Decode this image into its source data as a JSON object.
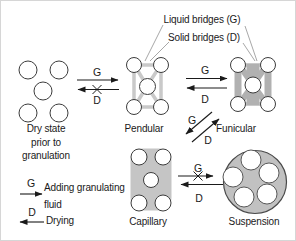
{
  "figure": "granulation-states-diagram",
  "annotations": {
    "liquid_bridges": "Liquid bridges (G)",
    "solid_bridges": "Solid bridges (D)"
  },
  "symbols": {
    "g": "G",
    "d": "D"
  },
  "stages": {
    "dry_state": {
      "line1": "Dry state",
      "line2": "prior to",
      "line3": "granulation"
    },
    "pendular": {
      "label": "Pendular"
    },
    "funicular": {
      "label": "Funicular"
    },
    "capillary": {
      "label": "Capillary"
    },
    "suspension": {
      "label": "Suspension"
    }
  },
  "legend": {
    "adding_line1": "Adding granulating",
    "adding_line2": "fluid",
    "drying": "Drying"
  },
  "colors": {
    "text": "#1a1a1a",
    "arrow": "#1a1a1a",
    "leader_line": "#a8a8a8",
    "liquid_bridge": "#c9c9c9",
    "solid_bridge": "#b1b1b1",
    "capillary_fill": "#c5c5c5",
    "suspension_fill": "#c1c1c1",
    "particle_fill": "#ffffff",
    "particle_stroke": "#3c3c3c",
    "background": "#ffffff"
  }
}
